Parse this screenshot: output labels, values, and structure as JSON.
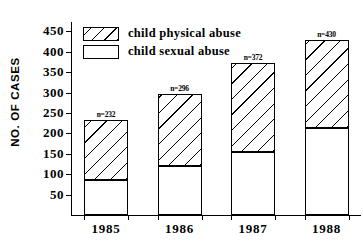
{
  "chart_data": {
    "type": "bar",
    "title": "",
    "subtitle": "",
    "xlabel": "",
    "ylabel": "NO. OF CASES",
    "categories": [
      "1985",
      "1986",
      "1987",
      "1988"
    ],
    "stacked": true,
    "series": [
      {
        "name": "child sexual abuse",
        "values": [
          85,
          119,
          154,
          214
        ]
      },
      {
        "name": "child physical abuse",
        "values": [
          147,
          177,
          218,
          216
        ]
      }
    ],
    "totals": [
      232,
      296,
      372,
      430
    ],
    "bar_labels": [
      "n=232",
      "n=296",
      "n=372",
      "n=430"
    ],
    "ylim": [
      0,
      460
    ],
    "yticks": [
      50,
      100,
      150,
      200,
      250,
      300,
      350,
      400,
      450
    ],
    "ytick_labels": [
      "50",
      "100",
      "150",
      "200",
      "250",
      "300",
      "350",
      "400",
      "450"
    ],
    "grid": false,
    "legend_position": "top-left",
    "legend": [
      {
        "label": "child physical abuse",
        "pattern": "diagonal-hatch",
        "color": "#000000"
      },
      {
        "label": "child sexual abuse",
        "pattern": "solid-white",
        "color": "#ffffff"
      }
    ]
  },
  "axis": {
    "y_title": "NO. OF CASES"
  },
  "legend": {
    "items": [
      {
        "label": "child physical abuse"
      },
      {
        "label": "child sexual abuse"
      }
    ]
  }
}
